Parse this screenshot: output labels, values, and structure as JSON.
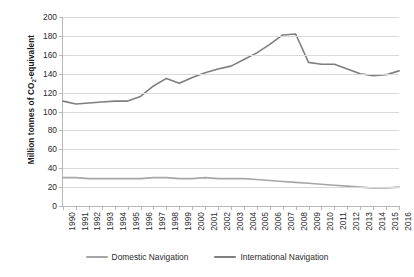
{
  "chart_data": {
    "type": "line",
    "title": "",
    "xlabel": "",
    "ylabel": "Million tonnes of CO2-equivalent",
    "ylabel_prefix": "Million tonnes of CO",
    "ylabel_sub": "2",
    "ylabel_suffix": "-equivalent",
    "ylim": [
      0,
      200
    ],
    "ytick_step": 20,
    "yticks": [
      0,
      20,
      40,
      60,
      80,
      100,
      120,
      140,
      160,
      180,
      200
    ],
    "grid": true,
    "legend_position": "bottom",
    "categories": [
      "1990",
      "1991",
      "1992",
      "1993",
      "1994",
      "1995",
      "1996",
      "1997",
      "1998",
      "1999",
      "2000",
      "2001",
      "2002",
      "2003",
      "2004",
      "2005",
      "2006",
      "2007",
      "2008",
      "2009",
      "2010",
      "2011",
      "2012",
      "2013",
      "2014",
      "2015",
      "2016"
    ],
    "series": [
      {
        "name": "Domestic Navigation",
        "color": "#a6a6a6",
        "values": [
          30,
          30,
          29,
          29,
          29,
          29,
          29,
          30,
          30,
          29,
          29,
          30,
          29,
          29,
          29,
          28,
          27,
          26,
          25,
          24,
          23,
          22,
          21,
          20,
          19,
          19,
          20
        ]
      },
      {
        "name": "International Navigation",
        "color": "#7f7f7f",
        "values": [
          111,
          108,
          109,
          110,
          111,
          111,
          116,
          127,
          135,
          130,
          136,
          141,
          145,
          148,
          155,
          162,
          171,
          181,
          182,
          152,
          150,
          150,
          145,
          140,
          138,
          139,
          143
        ]
      }
    ]
  },
  "legend": {
    "items": [
      {
        "label": "Domestic Navigation",
        "color": "#a6a6a6"
      },
      {
        "label": "International Navigation",
        "color": "#7f7f7f"
      }
    ]
  }
}
